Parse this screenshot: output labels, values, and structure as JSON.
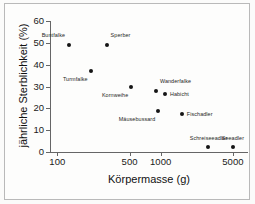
{
  "chart_data": {
    "type": "scatter",
    "title": "",
    "xlabel": "Körpermasse  (g)",
    "ylabel": "jährliche Sterblichkeit  (%)",
    "xscale": "log",
    "yscale": "linear",
    "xlim": [
      85,
      7000
    ],
    "ylim": [
      0,
      60
    ],
    "grid": false,
    "legend": "none",
    "xticks": [
      {
        "value": 100,
        "label": "100"
      },
      {
        "value": 500,
        "label": "500"
      },
      {
        "value": 1000,
        "label": "1000"
      },
      {
        "value": 5000,
        "label": "5000"
      }
    ],
    "yticks": [
      {
        "value": 0,
        "label": "0"
      },
      {
        "value": 10,
        "label": "10"
      },
      {
        "value": 20,
        "label": "20"
      },
      {
        "value": 30,
        "label": "30"
      },
      {
        "value": 40,
        "label": "40"
      },
      {
        "value": 50,
        "label": "50"
      },
      {
        "value": 60,
        "label": "60"
      }
    ],
    "marker": {
      "shape": "circle",
      "color": "#151515",
      "size_px": 4
    },
    "points": [
      {
        "label": "Buntfalke",
        "x": 130,
        "y": 49.0,
        "label_pos": "above-left"
      },
      {
        "label": "Sperber",
        "x": 300,
        "y": 49.0,
        "label_pos": "above-right"
      },
      {
        "label": "Turmfalke",
        "x": 210,
        "y": 37.0,
        "label_pos": "below-left"
      },
      {
        "label": "Kornweihe",
        "x": 520,
        "y": 30.0,
        "label_pos": "below-left"
      },
      {
        "label": "Wanderfalke",
        "x": 900,
        "y": 28.0,
        "label_pos": "above-right"
      },
      {
        "label": "Habicht",
        "x": 1100,
        "y": 26.5,
        "label_pos": "right"
      },
      {
        "label": "Mäusebussard",
        "x": 950,
        "y": 19.0,
        "label_pos": "below-left"
      },
      {
        "label": "Fischadler",
        "x": 1600,
        "y": 17.5,
        "label_pos": "right"
      },
      {
        "label": "Schreiseeadler",
        "x": 2900,
        "y": 2.5,
        "label_pos": "above"
      },
      {
        "label": "Seeadler",
        "x": 5000,
        "y": 2.5,
        "label_pos": "above"
      }
    ]
  }
}
